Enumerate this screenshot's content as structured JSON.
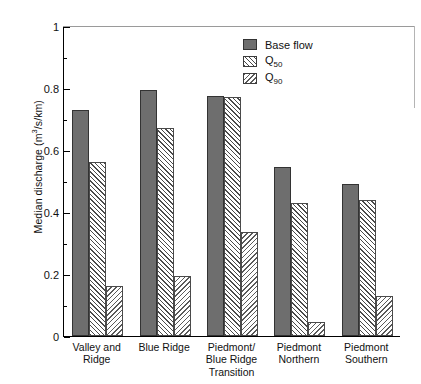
{
  "chart_data": {
    "type": "bar",
    "title": "",
    "xlabel": "",
    "ylabel": "Median discharge (m3/s/km)",
    "ylabel_parts": {
      "pre": "Median discharge (m",
      "sup": "3",
      "post": "/s/km)"
    },
    "ylim": [
      0,
      1
    ],
    "ytick_labels": [
      "0",
      "0.2",
      "0.4",
      "0.6",
      "0.8",
      "1"
    ],
    "ytick_values": [
      0,
      0.2,
      0.4,
      0.6,
      0.8,
      1
    ],
    "yminor_values": [
      0.1,
      0.3,
      0.5,
      0.7,
      0.9
    ],
    "grid": false,
    "legend_position": "top-right",
    "categories": [
      "Valley and Ridge",
      "Blue Ridge",
      "Piedmont/ Blue Ridge Transition",
      "Piedmont Northern",
      "Piedmont Southern"
    ],
    "category_lines": [
      [
        "Valley and",
        "Ridge"
      ],
      [
        "Blue Ridge"
      ],
      [
        "Piedmont/",
        "Blue Ridge",
        "Transition"
      ],
      [
        "Piedmont",
        "Northern"
      ],
      [
        "Piedmont",
        "Southern"
      ]
    ],
    "series": [
      {
        "name": "Base flow",
        "legend_label": "Base flow",
        "color": "#6e6e6e",
        "pattern": "solid",
        "values": [
          0.73,
          0.795,
          0.775,
          0.545,
          0.49
        ]
      },
      {
        "name": "Q50",
        "legend_label": "Q",
        "legend_sub": "50",
        "color": "#ffffff",
        "pattern": "hatch-forward",
        "values": [
          0.56,
          0.67,
          0.77,
          0.43,
          0.44
        ]
      },
      {
        "name": "Q90",
        "legend_label": "Q",
        "legend_sub": "90",
        "color": "#ffffff",
        "pattern": "hatch-backward",
        "values": [
          0.16,
          0.195,
          0.335,
          0.045,
          0.13
        ]
      }
    ]
  }
}
